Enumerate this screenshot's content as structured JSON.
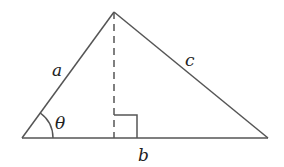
{
  "diagram": {
    "type": "triangle-with-altitude",
    "stroke_color": "#555555",
    "vertices": {
      "apex": [
        114,
        12
      ],
      "bottom_left": [
        22,
        138
      ],
      "bottom_right": [
        268,
        138
      ]
    },
    "labels": {
      "side_a": "a",
      "side_b": "b",
      "side_c": "c",
      "angle": "θ"
    },
    "altitude": {
      "style": "dashed",
      "x": 114
    },
    "right_angle_marker": {
      "size": 23
    }
  }
}
